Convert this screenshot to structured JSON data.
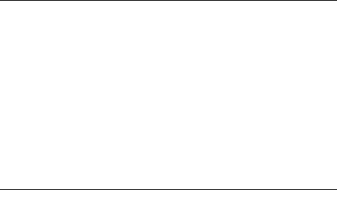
{
  "chart_data": {
    "type": "bar",
    "orientation": "horizontal",
    "title": "",
    "xlabel": "",
    "ylabel": "",
    "xlim": [
      0,
      115
    ],
    "grid": true,
    "legend": false,
    "tick_values": [
      0,
      25,
      50,
      75,
      100
    ],
    "tick_labels": [
      "0%",
      "",
      "50%",
      "",
      "100%"
    ],
    "categories": [
      "It doesn't bother me at all.",
      "It emotionally bothers me (aggregated from those who chose one or more answers such as “I know it shouldn't bother me, but it does.”).",
      "I want her to make an effort to take care of herself—not just for herself, but also for me.",
      "This question doesn't apply to me because my wife/significant other already looks great all the time, and I can't imagine her otherwise."
    ],
    "values": [
      12,
      70,
      47,
      20
    ],
    "value_labels": [
      "12%",
      "70%",
      "47%",
      "20%"
    ],
    "bar_color": "#8e8e8e",
    "note": "Note: because men could choose more than one answer, percentages"
  },
  "rows": [
    {
      "label": "It doesn't bother me at all.",
      "value": 12,
      "pct": "12%",
      "shaded": false
    },
    {
      "label": "It emotionally bothers me (aggregated from those who chose one or more answers such as “I know it shouldn't bother me, but it does.”).",
      "value": 70,
      "pct": "70%",
      "shaded": true
    },
    {
      "label": "I want her to make an effort to take care of herself—not just for herself, but also for me.",
      "value": 47,
      "pct": "47%",
      "shaded": false
    },
    {
      "label": "This question doesn't apply to me because my wife/significant other already looks great all the time, and I can't imagine her otherwise.",
      "value": 20,
      "pct": "20%",
      "shaded": true
    }
  ],
  "axis": {
    "labels": [
      {
        "text": "0%",
        "value": 0
      },
      {
        "text": "50%",
        "value": 50
      },
      {
        "text": "100%",
        "value": 100
      }
    ]
  },
  "footer": {
    "note": "Note: because men could choose more than one answer, percentages"
  }
}
